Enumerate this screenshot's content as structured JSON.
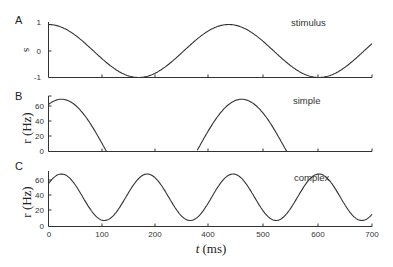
{
  "chart_data": [
    {
      "panel": "A",
      "type": "line",
      "label": "stimulus",
      "ylabel": "s",
      "xlabel": "",
      "xlim": [
        0,
        700
      ],
      "ylim": [
        -1,
        1
      ],
      "yticks": [
        -1,
        0,
        1
      ],
      "series": [
        {
          "name": "stimulus",
          "x": [
            0,
            50,
            100,
            150,
            195,
            250,
            300,
            350,
            390,
            450,
            500,
            550,
            585,
            650,
            700
          ],
          "values": [
            1,
            0.84,
            0.43,
            -0.38,
            -1,
            -0.58,
            0.01,
            0.64,
            1,
            0.55,
            -0.11,
            -0.78,
            -1,
            -0.51,
            0.4
          ]
        }
      ]
    },
    {
      "panel": "B",
      "type": "line",
      "label": "simple",
      "ylabel": "r (Hz)",
      "xlabel": "",
      "xlim": [
        0,
        700
      ],
      "ylim": [
        0,
        70
      ],
      "yticks": [
        0,
        20,
        40,
        60
      ],
      "series": [
        {
          "name": "simple",
          "x": [
            0,
            30,
            60,
            100,
            128,
            200,
            320,
            360,
            420,
            480,
            520,
            600,
            700
          ],
          "values": [
            58,
            65,
            56,
            22,
            0,
            0,
            0,
            42,
            67,
            42,
            0,
            0,
            0
          ]
        }
      ]
    },
    {
      "panel": "C",
      "type": "line",
      "label": "complex",
      "ylabel": "r (Hz)",
      "xlabel": "t (ms)",
      "xlim": [
        0,
        700
      ],
      "ylim": [
        0,
        75
      ],
      "yticks": [
        0,
        20,
        40,
        60
      ],
      "xtick_labels": [
        "0",
        "100",
        "200",
        "400",
        "500",
        "600",
        "700"
      ],
      "series": [
        {
          "name": "complex",
          "x": [
            0,
            28,
            117,
            210,
            308,
            395,
            485,
            580,
            670,
            700
          ],
          "values": [
            58,
            70,
            8,
            70,
            8,
            70,
            8,
            70,
            8,
            15
          ]
        }
      ]
    }
  ],
  "panels": {
    "A": {
      "letter": "A",
      "ylabel": "s",
      "label": "stimulus",
      "yticks": [
        "1",
        "0",
        "-1"
      ]
    },
    "B": {
      "letter": "B",
      "ylabel": "r (Hz)",
      "label": "simple",
      "yticks": [
        "60",
        "40",
        "20",
        "0"
      ]
    },
    "C": {
      "letter": "C",
      "ylabel": "r (Hz)",
      "label": "complex",
      "yticks": [
        "60",
        "40",
        "20",
        "0"
      ]
    }
  },
  "xaxis": {
    "tick_labels": [
      "0",
      "100",
      "200",
      "400",
      "500",
      "600",
      "700"
    ],
    "title_italic": "t",
    "title_unit": " (ms)"
  }
}
